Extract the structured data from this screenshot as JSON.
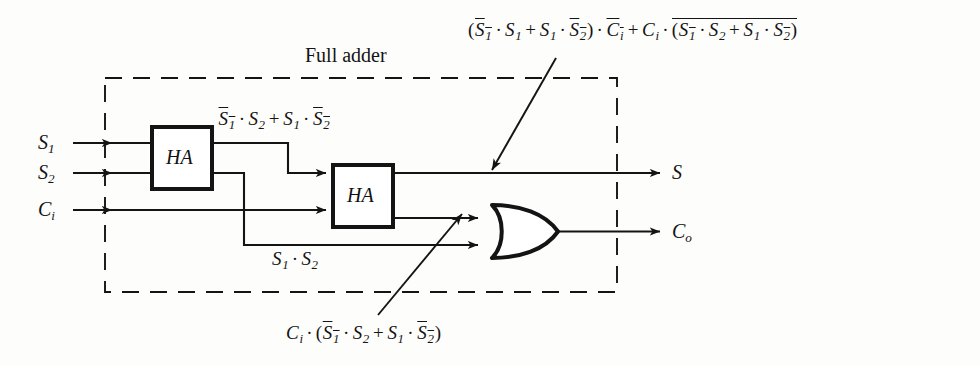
{
  "figure": {
    "title": "Full adder"
  },
  "boundary": {
    "caption": "Full adder",
    "style": "dashed"
  },
  "blocks": [
    {
      "id": "ha1",
      "label": "HA",
      "name": "half-adder-1"
    },
    {
      "id": "ha2",
      "label": "HA",
      "name": "half-adder-2"
    }
  ],
  "gates": [
    {
      "id": "or1",
      "label": "OR",
      "name": "or-gate"
    }
  ],
  "inputs": [
    {
      "id": "s1",
      "base": "S",
      "sub": "1"
    },
    {
      "id": "s2",
      "base": "S",
      "sub": "2"
    },
    {
      "id": "ci",
      "base": "C",
      "sub": "i"
    }
  ],
  "outputs": [
    {
      "id": "s",
      "base": "S",
      "sub": ""
    },
    {
      "id": "co",
      "base": "C",
      "sub": "o"
    }
  ],
  "annotations": {
    "ha1_sum": {
      "name": "ha1-sum-expression",
      "plain": "S1bar · S2 + S1 · S2bar"
    },
    "ha1_carry": {
      "name": "ha1-carry-expression",
      "plain": "S1 · S2"
    },
    "sum_out": {
      "name": "sum-output-expression",
      "plain": "(S1bar · S1 + S1 · S2bar) · Cibar + Ci · (S1bar · S2 + S1 · S2bar)bar"
    },
    "carry_partial": {
      "name": "carry-partial-expression",
      "plain": "Ci · (S1bar · S2 + S1 · S2bar)"
    }
  }
}
